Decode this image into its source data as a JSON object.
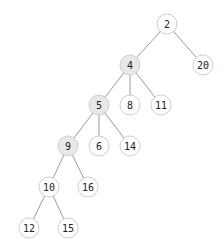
{
  "diagram": {
    "type": "tree",
    "width": 224,
    "height": 251,
    "node_radius": 10,
    "colors": {
      "background": "#ffffff",
      "edge": "#9a9a9a",
      "node_border": "#cfcfcf",
      "node_fill_default": "#ffffff",
      "node_fill_highlight": "#e8e8e8",
      "label": "#222222"
    },
    "nodes": [
      {
        "id": "n2",
        "label": "2",
        "x": 167,
        "y": 24,
        "highlight": false
      },
      {
        "id": "n4",
        "label": "4",
        "x": 130,
        "y": 65,
        "highlight": true
      },
      {
        "id": "n20",
        "label": "20",
        "x": 203,
        "y": 65,
        "highlight": false
      },
      {
        "id": "n5",
        "label": "5",
        "x": 99,
        "y": 105,
        "highlight": true
      },
      {
        "id": "n8",
        "label": "8",
        "x": 130,
        "y": 105,
        "highlight": false
      },
      {
        "id": "n11",
        "label": "11",
        "x": 161,
        "y": 105,
        "highlight": false
      },
      {
        "id": "n9",
        "label": "9",
        "x": 68,
        "y": 146,
        "highlight": true
      },
      {
        "id": "n6",
        "label": "6",
        "x": 99,
        "y": 146,
        "highlight": false
      },
      {
        "id": "n14",
        "label": "14",
        "x": 130,
        "y": 146,
        "highlight": false
      },
      {
        "id": "n10",
        "label": "10",
        "x": 49,
        "y": 187,
        "highlight": false
      },
      {
        "id": "n16",
        "label": "16",
        "x": 88,
        "y": 187,
        "highlight": false
      },
      {
        "id": "n12",
        "label": "12",
        "x": 29,
        "y": 228,
        "highlight": false
      },
      {
        "id": "n15",
        "label": "15",
        "x": 68,
        "y": 228,
        "highlight": false
      }
    ],
    "edges": [
      {
        "from": "n2",
        "to": "n4"
      },
      {
        "from": "n2",
        "to": "n20"
      },
      {
        "from": "n4",
        "to": "n5"
      },
      {
        "from": "n4",
        "to": "n8"
      },
      {
        "from": "n4",
        "to": "n11"
      },
      {
        "from": "n5",
        "to": "n9"
      },
      {
        "from": "n5",
        "to": "n6"
      },
      {
        "from": "n5",
        "to": "n14"
      },
      {
        "from": "n9",
        "to": "n10"
      },
      {
        "from": "n9",
        "to": "n16"
      },
      {
        "from": "n10",
        "to": "n12"
      },
      {
        "from": "n10",
        "to": "n15"
      }
    ]
  }
}
